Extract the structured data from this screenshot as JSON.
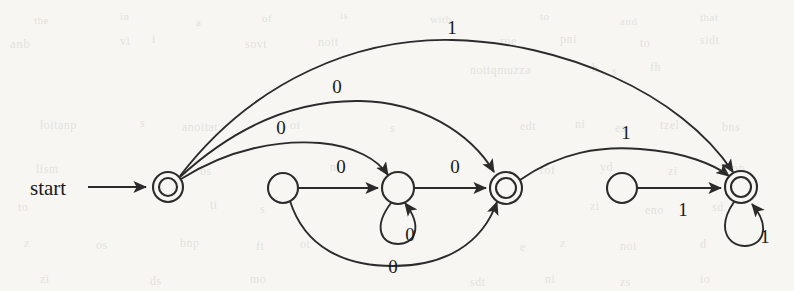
{
  "page": {
    "width": 794,
    "height": 291,
    "background_color": "#f7f6f3",
    "ink_color": "#2b2b2b",
    "kind": "scanned-textbook-figure"
  },
  "figure": {
    "type": "finite-automaton-state-diagram",
    "start_label": "start",
    "states": [
      {
        "id": "q0",
        "name": "state-q0",
        "cx": 168,
        "cy": 187,
        "r": 15,
        "accepting": true,
        "shape": "double-circle"
      },
      {
        "id": "q1",
        "name": "state-q1",
        "cx": 283,
        "cy": 188,
        "r": 15,
        "accepting": false,
        "shape": "circle"
      },
      {
        "id": "q2",
        "name": "state-q2",
        "cx": 398,
        "cy": 188,
        "r": 16,
        "accepting": false,
        "shape": "circle"
      },
      {
        "id": "q3",
        "name": "state-q3",
        "cx": 506,
        "cy": 188,
        "r": 16,
        "accepting": true,
        "shape": "double-circle"
      },
      {
        "id": "q4",
        "name": "state-q4",
        "cx": 622,
        "cy": 188,
        "r": 15,
        "accepting": false,
        "shape": "circle"
      },
      {
        "id": "q5",
        "name": "state-q5",
        "cx": 741,
        "cy": 187,
        "r": 16,
        "accepting": true,
        "shape": "double-circle"
      }
    ],
    "transitions": [
      {
        "id": "t-start",
        "name": "start-arrow",
        "from": "start",
        "to": "q0",
        "symbol": "",
        "style": "straight"
      },
      {
        "id": "t-q0-q5",
        "name": "edge-q0-to-q5-one",
        "from": "q0",
        "to": "q5",
        "symbol": "1",
        "style": "arc-high",
        "label_x": 452,
        "label_y": 34
      },
      {
        "id": "t-q0-q3",
        "name": "edge-q0-to-q3-zero",
        "from": "q0",
        "to": "q3",
        "symbol": "0",
        "style": "arc-mid",
        "label_x": 337,
        "label_y": 93
      },
      {
        "id": "t-q0-q2",
        "name": "edge-q0-to-q2-zero",
        "from": "q0",
        "to": "q2",
        "symbol": "0",
        "style": "arc-low",
        "label_x": 281,
        "label_y": 134
      },
      {
        "id": "t-q1-q2",
        "name": "edge-q1-to-q2-zero",
        "from": "q1",
        "to": "q2",
        "symbol": "0",
        "style": "straight",
        "label_x": 341,
        "label_y": 173
      },
      {
        "id": "t-q2-q2",
        "name": "self-loop-q2-zero",
        "from": "q2",
        "to": "q2",
        "symbol": "0",
        "style": "self-loop-down",
        "label_x": 410,
        "label_y": 241
      },
      {
        "id": "t-q2-q3",
        "name": "edge-q2-to-q3-zero",
        "from": "q2",
        "to": "q3",
        "symbol": "0",
        "style": "straight",
        "label_x": 455,
        "label_y": 173
      },
      {
        "id": "t-q1-q3",
        "name": "edge-q1-to-q3-zero",
        "from": "q1",
        "to": "q3",
        "symbol": "0",
        "style": "arc-below",
        "label_x": 393,
        "label_y": 273
      },
      {
        "id": "t-q3-q5",
        "name": "edge-q3-to-q5-one",
        "from": "q3",
        "to": "q5",
        "symbol": "1",
        "style": "arc-mid",
        "label_x": 626,
        "label_y": 139
      },
      {
        "id": "t-q4-q5",
        "name": "edge-q4-to-q5-one",
        "from": "q4",
        "to": "q5",
        "symbol": "1",
        "style": "straight",
        "label_x": 683,
        "label_y": 216
      },
      {
        "id": "t-q5-q5",
        "name": "self-loop-q5-one",
        "from": "q5",
        "to": "q5",
        "symbol": "1",
        "style": "self-loop-down",
        "label_x": 765,
        "label_y": 243
      }
    ],
    "alphabet": [
      "0",
      "1"
    ]
  },
  "background_text": {
    "note": "faint scanner bleed-through from the reverse page; illegible",
    "marks": [
      {
        "text": "the",
        "x": 34,
        "y": 14,
        "size": 11,
        "rot": 0
      },
      {
        "text": "in",
        "x": 120,
        "y": 10,
        "size": 11,
        "rot": 0
      },
      {
        "text": "a",
        "x": 196,
        "y": 16,
        "size": 11,
        "rot": 0
      },
      {
        "text": "of",
        "x": 262,
        "y": 12,
        "size": 11,
        "rot": 0
      },
      {
        "text": "is",
        "x": 340,
        "y": 9,
        "size": 11,
        "rot": 0
      },
      {
        "text": "with",
        "x": 430,
        "y": 13,
        "size": 11,
        "rot": 0
      },
      {
        "text": "to",
        "x": 540,
        "y": 10,
        "size": 11,
        "rot": 0
      },
      {
        "text": "and",
        "x": 620,
        "y": 15,
        "size": 11,
        "rot": 0
      },
      {
        "text": "that",
        "x": 700,
        "y": 11,
        "size": 11,
        "rot": 0
      },
      {
        "text": "anb",
        "x": 10,
        "y": 36,
        "size": 13,
        "rot": 0
      },
      {
        "text": "vi",
        "x": 120,
        "y": 34,
        "size": 12,
        "rot": 0
      },
      {
        "text": "i",
        "x": 152,
        "y": 32,
        "size": 12,
        "rot": 0
      },
      {
        "text": "sovt",
        "x": 245,
        "y": 37,
        "size": 12,
        "rot": 0
      },
      {
        "text": "noit",
        "x": 318,
        "y": 35,
        "size": 12,
        "rot": 0
      },
      {
        "text": "rue",
        "x": 500,
        "y": 34,
        "size": 12,
        "rot": 0
      },
      {
        "text": "pni",
        "x": 560,
        "y": 32,
        "size": 12,
        "rot": 0
      },
      {
        "text": "to",
        "x": 640,
        "y": 36,
        "size": 12,
        "rot": 0
      },
      {
        "text": "sidt",
        "x": 700,
        "y": 33,
        "size": 12,
        "rot": 0
      },
      {
        "text": "noitqmuzza",
        "x": 470,
        "y": 63,
        "size": 12,
        "rot": 0
      },
      {
        "text": "b",
        "x": 592,
        "y": 61,
        "size": 12,
        "rot": 0
      },
      {
        "text": "s",
        "x": 612,
        "y": 64,
        "size": 12,
        "rot": 0
      },
      {
        "text": "fh",
        "x": 650,
        "y": 60,
        "size": 12,
        "rot": 0
      },
      {
        "text": "loitanp",
        "x": 40,
        "y": 118,
        "size": 12,
        "rot": 0
      },
      {
        "text": "s",
        "x": 140,
        "y": 116,
        "size": 12,
        "rot": 0
      },
      {
        "text": "anoitat",
        "x": 182,
        "y": 120,
        "size": 12,
        "rot": 0
      },
      {
        "text": "oi",
        "x": 290,
        "y": 118,
        "size": 12,
        "rot": 0
      },
      {
        "text": "s",
        "x": 390,
        "y": 121,
        "size": 12,
        "rot": 0
      },
      {
        "text": "edt",
        "x": 520,
        "y": 119,
        "size": 12,
        "rot": 0
      },
      {
        "text": "ni",
        "x": 575,
        "y": 117,
        "size": 12,
        "rot": 0
      },
      {
        "text": "es",
        "x": 615,
        "y": 121,
        "size": 12,
        "rot": 0
      },
      {
        "text": "tzel",
        "x": 660,
        "y": 118,
        "size": 12,
        "rot": 0
      },
      {
        "text": "bns",
        "x": 722,
        "y": 120,
        "size": 12,
        "rot": 0
      },
      {
        "text": "lism",
        "x": 36,
        "y": 162,
        "size": 12,
        "rot": 0
      },
      {
        "text": "bs",
        "x": 200,
        "y": 164,
        "size": 12,
        "rot": 0
      },
      {
        "text": "ni",
        "x": 330,
        "y": 160,
        "size": 12,
        "rot": 0
      },
      {
        "text": "rof",
        "x": 540,
        "y": 163,
        "size": 12,
        "rot": 0
      },
      {
        "text": "yd",
        "x": 600,
        "y": 160,
        "size": 12,
        "rot": 0
      },
      {
        "text": "zi",
        "x": 668,
        "y": 164,
        "size": 12,
        "rot": 0
      },
      {
        "text": "ton",
        "x": 728,
        "y": 161,
        "size": 12,
        "rot": 0
      },
      {
        "text": "to",
        "x": 18,
        "y": 200,
        "size": 12,
        "rot": 0
      },
      {
        "text": "ti",
        "x": 210,
        "y": 198,
        "size": 12,
        "rot": 0
      },
      {
        "text": "s",
        "x": 260,
        "y": 202,
        "size": 12,
        "rot": 0
      },
      {
        "text": "zi",
        "x": 590,
        "y": 199,
        "size": 12,
        "rot": 0
      },
      {
        "text": "eno",
        "x": 645,
        "y": 203,
        "size": 12,
        "rot": 0
      },
      {
        "text": "sd",
        "x": 712,
        "y": 200,
        "size": 12,
        "rot": 0
      },
      {
        "text": "z",
        "x": 24,
        "y": 236,
        "size": 12,
        "rot": 0
      },
      {
        "text": "os",
        "x": 96,
        "y": 238,
        "size": 12,
        "rot": 0
      },
      {
        "text": "bnp",
        "x": 180,
        "y": 236,
        "size": 12,
        "rot": 0
      },
      {
        "text": "ft",
        "x": 256,
        "y": 239,
        "size": 12,
        "rot": 0
      },
      {
        "text": "ot",
        "x": 300,
        "y": 237,
        "size": 12,
        "rot": 0
      },
      {
        "text": "e",
        "x": 520,
        "y": 240,
        "size": 12,
        "rot": 0
      },
      {
        "text": "z",
        "x": 560,
        "y": 236,
        "size": 12,
        "rot": 0
      },
      {
        "text": "noi",
        "x": 620,
        "y": 239,
        "size": 12,
        "rot": 0
      },
      {
        "text": "d",
        "x": 700,
        "y": 237,
        "size": 12,
        "rot": 0
      },
      {
        "text": "zi",
        "x": 40,
        "y": 272,
        "size": 12,
        "rot": 0
      },
      {
        "text": "ds",
        "x": 150,
        "y": 274,
        "size": 12,
        "rot": 0
      },
      {
        "text": "mo",
        "x": 250,
        "y": 272,
        "size": 12,
        "rot": 0
      },
      {
        "text": "sdt",
        "x": 470,
        "y": 275,
        "size": 12,
        "rot": 0
      },
      {
        "text": "ni",
        "x": 545,
        "y": 272,
        "size": 12,
        "rot": 0
      },
      {
        "text": "zs",
        "x": 620,
        "y": 275,
        "size": 12,
        "rot": 0
      },
      {
        "text": "io",
        "x": 700,
        "y": 272,
        "size": 12,
        "rot": 0
      }
    ]
  }
}
